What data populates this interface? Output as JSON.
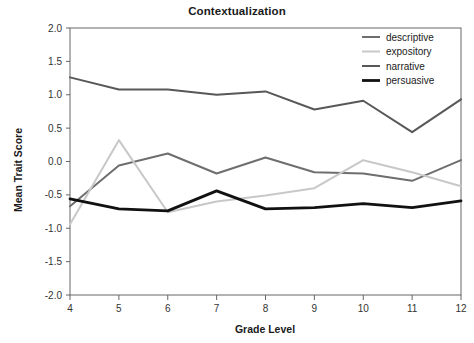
{
  "chart_data": {
    "type": "line",
    "title": "Contextualization",
    "xlabel": "Grade Level",
    "ylabel": "Mean Trait Score",
    "x": [
      4,
      5,
      6,
      7,
      8,
      9,
      10,
      11,
      12
    ],
    "categories": [
      "4",
      "5",
      "6",
      "7",
      "8",
      "9",
      "10",
      "11",
      "12"
    ],
    "xlim": [
      4,
      12
    ],
    "ylim": [
      -2.0,
      2.0
    ],
    "yticks": [
      "2.0",
      "1.5",
      "1.0",
      "0.5",
      "0.0",
      "-0.5",
      "-1.0",
      "-1.5",
      "-2.0"
    ],
    "ytick_values": [
      2.0,
      1.5,
      1.0,
      0.5,
      0.0,
      -0.5,
      -1.0,
      -1.5,
      -2.0
    ],
    "grid": false,
    "legend_position": "top-right",
    "series": [
      {
        "name": "descriptive",
        "color": "#6e6e6e",
        "width": 2.0,
        "values": [
          -0.67,
          -0.06,
          0.12,
          -0.18,
          0.06,
          -0.16,
          -0.18,
          -0.29,
          0.02
        ]
      },
      {
        "name": "expository",
        "color": "#c8c8c8",
        "width": 2.0,
        "values": [
          -0.94,
          0.32,
          -0.76,
          -0.6,
          -0.51,
          -0.4,
          0.02,
          -0.16,
          -0.37
        ]
      },
      {
        "name": "narrative",
        "color": "#585858",
        "width": 2.0,
        "values": [
          1.26,
          1.08,
          1.08,
          1.0,
          1.05,
          0.78,
          0.91,
          0.44,
          0.93
        ]
      },
      {
        "name": "persuasive",
        "color": "#111111",
        "width": 2.8,
        "values": [
          -0.56,
          -0.71,
          -0.74,
          -0.44,
          -0.71,
          -0.69,
          -0.63,
          -0.69,
          -0.59
        ]
      }
    ]
  },
  "legend": {
    "items": [
      {
        "label": "descriptive"
      },
      {
        "label": "expository"
      },
      {
        "label": "narrative"
      },
      {
        "label": "persuasive"
      }
    ]
  }
}
